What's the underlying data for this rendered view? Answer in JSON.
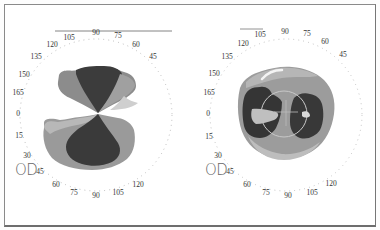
{
  "figure": {
    "maps": [
      {
        "id": "left",
        "eye_label": "OD",
        "upper_ticks": [
          {
            "label": "105",
            "x": 69,
            "y": 38
          },
          {
            "label": "90",
            "x": 96,
            "y": 33
          },
          {
            "label": "75",
            "x": 118,
            "y": 36
          },
          {
            "label": "60",
            "x": 136,
            "y": 45
          },
          {
            "label": "45",
            "x": 153,
            "y": 57
          },
          {
            "label": "120",
            "x": 52,
            "y": 45
          },
          {
            "label": "135",
            "x": 36,
            "y": 57
          },
          {
            "label": "150",
            "x": 24,
            "y": 75
          },
          {
            "label": "165",
            "x": 18,
            "y": 93
          },
          {
            "label": "0",
            "x": 18,
            "y": 114
          },
          {
            "label": "15",
            "x": 19,
            "y": 136
          },
          {
            "label": "30",
            "x": 27,
            "y": 156
          }
        ],
        "lower_ticks": [
          {
            "label": "45",
            "x": 40,
            "y": 172
          },
          {
            "label": "60",
            "x": 56,
            "y": 185
          },
          {
            "label": "75",
            "x": 74,
            "y": 193
          },
          {
            "label": "90",
            "x": 96,
            "y": 196
          },
          {
            "label": "105",
            "x": 118,
            "y": 193
          },
          {
            "label": "120",
            "x": 138,
            "y": 185
          }
        ]
      },
      {
        "id": "right",
        "eye_label": "OD",
        "upper_ticks": [
          {
            "label": "105",
            "x": 70,
            "y": 35
          },
          {
            "label": "90",
            "x": 95,
            "y": 32
          },
          {
            "label": "75",
            "x": 117,
            "y": 34
          },
          {
            "label": "60",
            "x": 135,
            "y": 42
          },
          {
            "label": "45",
            "x": 153,
            "y": 55
          },
          {
            "label": "120",
            "x": 53,
            "y": 44
          },
          {
            "label": "135",
            "x": 37,
            "y": 57
          },
          {
            "label": "150",
            "x": 24,
            "y": 74
          },
          {
            "label": "165",
            "x": 19,
            "y": 93
          },
          {
            "label": "0",
            "x": 18,
            "y": 114
          },
          {
            "label": "15",
            "x": 19,
            "y": 137
          },
          {
            "label": "30",
            "x": 28,
            "y": 156
          }
        ],
        "lower_ticks": [
          {
            "label": "45",
            "x": 40,
            "y": 172
          },
          {
            "label": "60",
            "x": 57,
            "y": 185
          },
          {
            "label": "75",
            "x": 76,
            "y": 193
          },
          {
            "label": "90",
            "x": 98,
            "y": 196
          },
          {
            "label": "105",
            "x": 122,
            "y": 193
          },
          {
            "label": "120",
            "x": 141,
            "y": 184
          }
        ]
      }
    ],
    "colors": {
      "dark": "#3a3a3a",
      "mid": "#8a8a8a",
      "light": "#b4b4b4",
      "lighter": "#cfcfcf",
      "border": "#8a8a8a"
    }
  }
}
